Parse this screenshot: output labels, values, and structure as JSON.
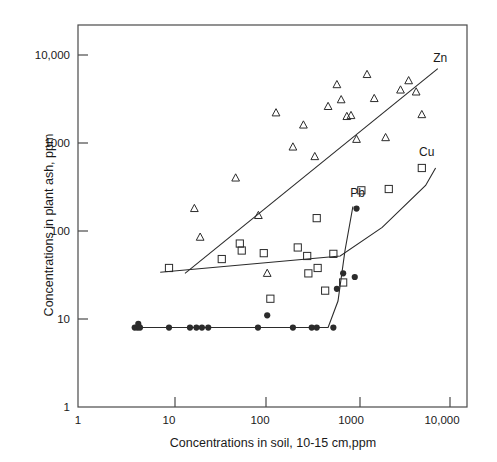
{
  "chart_data": {
    "type": "scatter",
    "title": "",
    "xlabel": "Concentrations in soil, 10-15 cm,ppm",
    "ylabel": "Concentrations in plant ash, ppm",
    "xscale": "log",
    "yscale": "log",
    "xlim": [
      1,
      25000
    ],
    "ylim": [
      1,
      30000
    ],
    "xticks": [
      1,
      10,
      100,
      1000,
      10000
    ],
    "xtick_labels": [
      "1",
      "10",
      "100",
      "1000",
      "10,000"
    ],
    "yticks": [
      1,
      10,
      100,
      1000,
      10000
    ],
    "ytick_labels": [
      "1",
      "10",
      "100",
      "1000",
      "10,000"
    ],
    "grid": false,
    "legend_position": "inline-annotations",
    "series": [
      {
        "name": "Zn",
        "marker": "open-triangle",
        "label": "Zn",
        "label_xy": [
          8000,
          9000
        ],
        "points": [
          [
            19,
            180
          ],
          [
            22,
            85
          ],
          [
            54,
            400
          ],
          [
            96,
            150
          ],
          [
            120,
            33
          ],
          [
            150,
            2200
          ],
          [
            230,
            900
          ],
          [
            300,
            1600
          ],
          [
            400,
            700
          ],
          [
            560,
            2600
          ],
          [
            700,
            4600
          ],
          [
            780,
            3100
          ],
          [
            900,
            2000
          ],
          [
            1000,
            2050
          ],
          [
            1150,
            1100
          ],
          [
            1500,
            6000
          ],
          [
            1800,
            3200
          ],
          [
            2400,
            1150
          ],
          [
            3500,
            4000
          ],
          [
            4300,
            5100
          ],
          [
            5200,
            3800
          ],
          [
            6000,
            2100
          ]
        ],
        "trend_line": [
          [
            15,
            33
          ],
          [
            9000,
            7000
          ]
        ]
      },
      {
        "name": "Cu",
        "marker": "open-square",
        "label": "Cu",
        "label_xy": [
          5600,
          760
        ],
        "points": [
          [
            10,
            38
          ],
          [
            38,
            48
          ],
          [
            60,
            72
          ],
          [
            63,
            60
          ],
          [
            110,
            56
          ],
          [
            130,
            17
          ],
          [
            260,
            65
          ],
          [
            330,
            52
          ],
          [
            340,
            33
          ],
          [
            420,
            140
          ],
          [
            430,
            38
          ],
          [
            520,
            21
          ],
          [
            640,
            55
          ],
          [
            820,
            26
          ],
          [
            1300,
            290
          ],
          [
            2600,
            300
          ],
          [
            6000,
            520
          ]
        ],
        "trend_line": [
          [
            8,
            34
          ],
          [
            760,
            52
          ],
          [
            2200,
            110
          ],
          [
            6600,
            330
          ],
          [
            8500,
            520
          ]
        ]
      },
      {
        "name": "Pb",
        "marker": "filled-circle",
        "label": "Pb",
        "label_xy": [
          980,
          265
        ],
        "points": [
          [
            4.2,
            8
          ],
          [
            4.5,
            8
          ],
          [
            4.6,
            8.8
          ],
          [
            4.8,
            8
          ],
          [
            10,
            8
          ],
          [
            17,
            8
          ],
          [
            20,
            8
          ],
          [
            23,
            8
          ],
          [
            27,
            8
          ],
          [
            95,
            8
          ],
          [
            120,
            11
          ],
          [
            230,
            8
          ],
          [
            370,
            8
          ],
          [
            420,
            8
          ],
          [
            640,
            8
          ],
          [
            700,
            22
          ],
          [
            820,
            33
          ],
          [
            1100,
            30
          ],
          [
            1150,
            180
          ]
        ],
        "trend_line": [
          [
            4,
            8
          ],
          [
            560,
            8
          ],
          [
            720,
            16
          ],
          [
            860,
            60
          ],
          [
            1050,
            190
          ]
        ]
      }
    ]
  },
  "axes": {
    "frame_color": "#4a4a4a",
    "marker_color": "#2b2b2b",
    "line_color": "#2b2b2b"
  }
}
